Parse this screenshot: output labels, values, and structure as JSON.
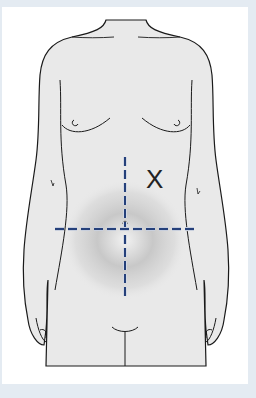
{
  "figure": {
    "quadrant_lines": {
      "style": "dashed",
      "color": "#25407a",
      "vertical": {
        "x": 125,
        "y1": 157,
        "y2": 300
      },
      "horizontal": {
        "y": 229,
        "x1": 55,
        "x2": 195
      },
      "intersection": {
        "x": 125,
        "y": 229
      }
    },
    "marker": {
      "label": "X",
      "position": "left upper quadrant (patient's left, viewer's right)"
    },
    "shading": {
      "description": "gray radial shading over lower abdomen",
      "color": "#9a9a9a"
    },
    "colors": {
      "background": "#e4ebf2",
      "panel": "#ffffff",
      "body_fill": "#e9e9e9",
      "outline": "#1a1a1a"
    }
  }
}
